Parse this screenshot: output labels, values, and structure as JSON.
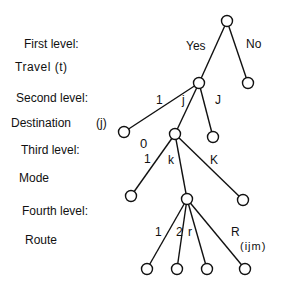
{
  "levels": [
    {
      "heading": "First level:",
      "name": "Travel  (t)"
    },
    {
      "heading": "Second level:",
      "name": "Destination",
      "index": "(j)"
    },
    {
      "heading": "Third level:",
      "name": "Mode"
    },
    {
      "heading": "Fourth level:",
      "name": "Route"
    }
  ],
  "edge_labels": {
    "yes": "Yes",
    "no": "No",
    "dest_1": "1",
    "dest_j": "j",
    "dest_J": "J",
    "mode_0": "0",
    "mode_1": "1",
    "mode_k": "k",
    "mode_K": "K",
    "route_1": "1",
    "route_2": "2",
    "route_r": "r",
    "route_R": "R",
    "route_sub": "(ijm)"
  },
  "nodes": [
    {
      "id": "root",
      "x": 227,
      "y": 21
    },
    {
      "id": "yes",
      "x": 199,
      "y": 83
    },
    {
      "id": "no",
      "x": 248,
      "y": 83
    },
    {
      "id": "d1",
      "x": 124,
      "y": 132
    },
    {
      "id": "dj",
      "x": 175,
      "y": 134
    },
    {
      "id": "dJ",
      "x": 213,
      "y": 137
    },
    {
      "id": "m1",
      "x": 131,
      "y": 196
    },
    {
      "id": "mk",
      "x": 187,
      "y": 199
    },
    {
      "id": "mK",
      "x": 243,
      "y": 200
    },
    {
      "id": "r1",
      "x": 147,
      "y": 269
    },
    {
      "id": "r2",
      "x": 177,
      "y": 269
    },
    {
      "id": "rr",
      "x": 207,
      "y": 269
    },
    {
      "id": "rR",
      "x": 245,
      "y": 269
    }
  ]
}
